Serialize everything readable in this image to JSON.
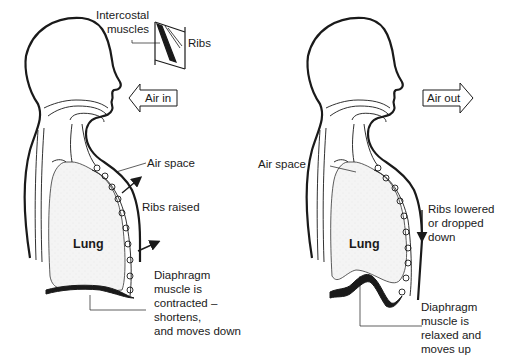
{
  "diagram": {
    "type": "breathing-mechanics",
    "colors": {
      "line": "#1a1a1a",
      "lung_fill": "#f3f3f3",
      "background": "#ffffff"
    },
    "inhale_panel": {
      "inset_labels": {
        "intercostal": "Intercostal\nmuscles",
        "ribs": "Ribs"
      },
      "air_arrow": "Air in",
      "air_space": "Air space",
      "ribs_state": "Ribs raised",
      "lung": "Lung",
      "diaphragm": "Diaphragm\nmuscle is\ncontracted –\nshortens,\nand moves down"
    },
    "exhale_panel": {
      "air_arrow": "Air out",
      "air_space": "Air space",
      "ribs_state": "Ribs lowered\nor dropped\ndown",
      "lung": "Lung",
      "diaphragm": "Diaphragm\nmuscle is\nrelaxed and\nmoves up"
    }
  }
}
